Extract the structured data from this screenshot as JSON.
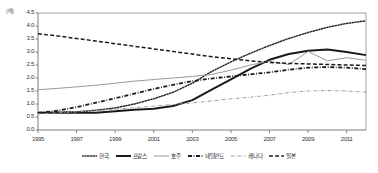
{
  "chart_data": {
    "type": "line",
    "title": "",
    "xlabel": "",
    "ylabel": "",
    "unit_label": "(배)",
    "xlim": [
      1995,
      2012
    ],
    "ylim": [
      0.0,
      4.5
    ],
    "grid": false,
    "legend_position": "bottom",
    "x": [
      1995,
      1996,
      1997,
      1998,
      1999,
      2000,
      2001,
      2002,
      2003,
      2004,
      2005,
      2006,
      2007,
      2008,
      2009,
      2010,
      2011,
      2012
    ],
    "x_tick_labels": [
      "1995",
      "1997",
      "1999",
      "2001",
      "2003",
      "2005",
      "2007",
      "2009",
      "2011"
    ],
    "y_tick_labels": [
      "0.0",
      "0.5",
      "1.0",
      "1.5",
      "2.0",
      "2.5",
      "3.0",
      "3.5",
      "4.0",
      "4.5"
    ],
    "series": [
      {
        "name": "한국",
        "style": "dotted",
        "color": "#2b2b2b",
        "width": 1.5,
        "values": [
          0.66,
          0.68,
          0.7,
          0.76,
          0.85,
          1.0,
          1.2,
          1.45,
          1.8,
          2.25,
          2.62,
          2.95,
          3.25,
          3.52,
          3.75,
          3.95,
          4.1,
          4.2
        ]
      },
      {
        "name": "프랑스",
        "style": "solid-thick",
        "color": "#1a1a1a",
        "width": 2.0,
        "values": [
          0.66,
          0.66,
          0.66,
          0.66,
          0.72,
          0.78,
          0.82,
          0.92,
          1.15,
          1.55,
          1.95,
          2.35,
          2.7,
          2.92,
          3.05,
          3.1,
          3.0,
          2.88
        ]
      },
      {
        "name": "호주",
        "style": "solid-thin",
        "color": "#9a9a9a",
        "width": 1.0,
        "values": [
          1.55,
          1.6,
          1.66,
          1.72,
          1.8,
          1.88,
          1.94,
          2.0,
          2.06,
          2.14,
          2.3,
          2.5,
          2.64,
          2.52,
          3.02,
          2.66,
          2.78,
          2.68
        ]
      },
      {
        "name": "네덜란드",
        "style": "dashdot-thick",
        "color": "#1a1a1a",
        "width": 1.8,
        "values": [
          0.66,
          0.74,
          0.88,
          1.05,
          1.22,
          1.4,
          1.58,
          1.74,
          1.88,
          1.98,
          2.06,
          2.14,
          2.22,
          2.32,
          2.4,
          2.42,
          2.4,
          2.34
        ]
      },
      {
        "name": "캐나다",
        "style": "dashdot-thin",
        "color": "#9a9a9a",
        "width": 1.0,
        "values": [
          0.62,
          0.66,
          0.7,
          0.74,
          0.8,
          0.86,
          0.92,
          0.98,
          1.04,
          1.12,
          1.2,
          1.26,
          1.34,
          1.44,
          1.5,
          1.52,
          1.5,
          1.46
        ]
      },
      {
        "name": "일본",
        "style": "dashed",
        "color": "#1a1a1a",
        "width": 1.5,
        "values": [
          3.7,
          3.62,
          3.52,
          3.42,
          3.32,
          3.22,
          3.12,
          3.02,
          2.92,
          2.82,
          2.74,
          2.66,
          2.6,
          2.56,
          2.54,
          2.52,
          2.5,
          2.48
        ]
      }
    ]
  },
  "legend": {
    "items": [
      {
        "label": "한국"
      },
      {
        "label": "프랑스"
      },
      {
        "label": "호주"
      },
      {
        "label": "네덜란드"
      },
      {
        "label": "캐나다"
      },
      {
        "label": "일본"
      }
    ]
  }
}
